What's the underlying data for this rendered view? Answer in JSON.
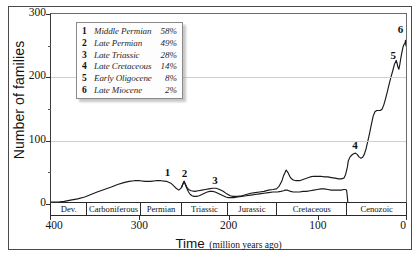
{
  "chart_data": {
    "type": "line",
    "title": "",
    "xlabel_main": "Time",
    "xlabel_sub": "(million years ago)",
    "ylabel": "Number of families",
    "xlim": [
      400,
      0
    ],
    "ylim": [
      0,
      300
    ],
    "x_reversed": true,
    "grid": true,
    "legend_position": "top-left-inside",
    "y_ticks": [
      0,
      100,
      200,
      300
    ],
    "y_tick_labels": [
      "0",
      "100",
      "200",
      "300"
    ],
    "y_minor_ticks": [
      50,
      150,
      250
    ],
    "x_ticks": [
      400,
      300,
      200,
      100,
      0
    ],
    "x_tick_labels": [
      "400",
      "300",
      "200",
      "100",
      "0"
    ],
    "periods": [
      {
        "label": "Dev.",
        "start": 400,
        "end": 359
      },
      {
        "label": "Carboniferous",
        "start": 359,
        "end": 299
      },
      {
        "label": "Permian",
        "start": 299,
        "end": 252
      },
      {
        "label": "Triassic",
        "start": 252,
        "end": 201
      },
      {
        "label": "Jurassic",
        "start": 201,
        "end": 145
      },
      {
        "label": "Cretaceous",
        "start": 145,
        "end": 66
      },
      {
        "label": "Cenozoic",
        "start": 66,
        "end": 0
      }
    ],
    "series": [
      {
        "name": "total-families",
        "points": [
          [
            400,
            0
          ],
          [
            392,
            0
          ],
          [
            385,
            1
          ],
          [
            378,
            3
          ],
          [
            370,
            5
          ],
          [
            362,
            8
          ],
          [
            355,
            12
          ],
          [
            348,
            16
          ],
          [
            340,
            20
          ],
          [
            332,
            24
          ],
          [
            325,
            28
          ],
          [
            318,
            31
          ],
          [
            312,
            33
          ],
          [
            306,
            34
          ],
          [
            300,
            34
          ],
          [
            294,
            33
          ],
          [
            288,
            33
          ],
          [
            282,
            34
          ],
          [
            276,
            34
          ],
          [
            270,
            33
          ],
          [
            265,
            30
          ],
          [
            262,
            26
          ],
          [
            259,
            22
          ],
          [
            256,
            19
          ],
          [
            253,
            23
          ],
          [
            251,
            30
          ],
          [
            250,
            33
          ],
          [
            249,
            30
          ],
          [
            247,
            24
          ],
          [
            245,
            20
          ],
          [
            242,
            18
          ],
          [
            238,
            17
          ],
          [
            234,
            18
          ],
          [
            230,
            19
          ],
          [
            226,
            20
          ],
          [
            222,
            21
          ],
          [
            218,
            22
          ],
          [
            214,
            22
          ],
          [
            210,
            20
          ],
          [
            206,
            17
          ],
          [
            202,
            13
          ],
          [
            198,
            10
          ],
          [
            195,
            9
          ],
          [
            190,
            9
          ],
          [
            185,
            10
          ],
          [
            180,
            12
          ],
          [
            175,
            14
          ],
          [
            170,
            15
          ],
          [
            165,
            16
          ],
          [
            160,
            17
          ],
          [
            155,
            19
          ],
          [
            150,
            20
          ],
          [
            146,
            21
          ],
          [
            143,
            25
          ],
          [
            140,
            33
          ],
          [
            138,
            42
          ],
          [
            136,
            48
          ],
          [
            135,
            51
          ],
          [
            133,
            47
          ],
          [
            131,
            41
          ],
          [
            129,
            37
          ],
          [
            127,
            35
          ],
          [
            124,
            34
          ],
          [
            120,
            34
          ],
          [
            116,
            36
          ],
          [
            112,
            38
          ],
          [
            108,
            40
          ],
          [
            104,
            41
          ],
          [
            100,
            41
          ],
          [
            96,
            41
          ],
          [
            92,
            40
          ],
          [
            88,
            40
          ],
          [
            84,
            39
          ],
          [
            80,
            38
          ],
          [
            76,
            37
          ],
          [
            73,
            37
          ],
          [
            70,
            38
          ],
          [
            68,
            44
          ],
          [
            66,
            56
          ],
          [
            65,
            66
          ],
          [
            63,
            72
          ],
          [
            61,
            75
          ],
          [
            59,
            77
          ],
          [
            57,
            78
          ],
          [
            55,
            76
          ],
          [
            53,
            72
          ],
          [
            51,
            70
          ],
          [
            49,
            71
          ],
          [
            47,
            76
          ],
          [
            45,
            85
          ],
          [
            43,
            97
          ],
          [
            41,
            110
          ],
          [
            39,
            124
          ],
          [
            37,
            137
          ],
          [
            35,
            144
          ],
          [
            33,
            146
          ],
          [
            31,
            146
          ],
          [
            29,
            146
          ],
          [
            27,
            148
          ],
          [
            25,
            155
          ],
          [
            23,
            165
          ],
          [
            21,
            176
          ],
          [
            19,
            188
          ],
          [
            17,
            199
          ],
          [
            15,
            209
          ],
          [
            13,
            220
          ],
          [
            11,
            226
          ],
          [
            10,
            221
          ],
          [
            9,
            215
          ],
          [
            8,
            212
          ],
          [
            7,
            219
          ],
          [
            6,
            228
          ],
          [
            5,
            236
          ],
          [
            4,
            243
          ],
          [
            3,
            249
          ],
          [
            2,
            252
          ],
          [
            1,
            254
          ],
          [
            0.6,
            258
          ],
          [
            0.3,
            253
          ],
          [
            0,
            249
          ]
        ]
      },
      {
        "name": "lower-curve",
        "points": [
          [
            253,
            23
          ],
          [
            251,
            30
          ],
          [
            250,
            33
          ],
          [
            249,
            29
          ],
          [
            247,
            22
          ],
          [
            245,
            16
          ],
          [
            243,
            12
          ],
          [
            241,
            10
          ],
          [
            239,
            9
          ],
          [
            236,
            9
          ],
          [
            233,
            10
          ],
          [
            230,
            12
          ],
          [
            227,
            14
          ],
          [
            224,
            16
          ],
          [
            221,
            17
          ],
          [
            218,
            17
          ],
          [
            215,
            16
          ],
          [
            212,
            14
          ],
          [
            209,
            12
          ],
          [
            206,
            10
          ],
          [
            203,
            8
          ],
          [
            200,
            7
          ],
          [
            197,
            7
          ],
          [
            194,
            7
          ],
          [
            190,
            8
          ],
          [
            185,
            9
          ],
          [
            180,
            10
          ],
          [
            175,
            11
          ],
          [
            170,
            12
          ],
          [
            165,
            13
          ],
          [
            160,
            14
          ],
          [
            155,
            15
          ],
          [
            150,
            16
          ],
          [
            145,
            16
          ],
          [
            141,
            17
          ],
          [
            138,
            18
          ],
          [
            136,
            19
          ],
          [
            134,
            19
          ],
          [
            132,
            18
          ],
          [
            130,
            17
          ],
          [
            127,
            16
          ],
          [
            124,
            16
          ],
          [
            120,
            16
          ],
          [
            116,
            17
          ],
          [
            112,
            17
          ],
          [
            108,
            18
          ],
          [
            104,
            19
          ],
          [
            100,
            20
          ],
          [
            96,
            21
          ],
          [
            92,
            21
          ],
          [
            88,
            20
          ],
          [
            84,
            19
          ],
          [
            80,
            19
          ],
          [
            76,
            19
          ],
          [
            73,
            19
          ],
          [
            70,
            20
          ],
          [
            68,
            20
          ],
          [
            67,
            19
          ],
          [
            66.5,
            14
          ],
          [
            66,
            7
          ],
          [
            65.7,
            2
          ],
          [
            65.5,
            0
          ]
        ]
      }
    ],
    "markers": [
      {
        "id": "1",
        "label": "1",
        "x": 268,
        "y": 34,
        "event": "Middle Permian",
        "extinction_pct": "58%"
      },
      {
        "id": "2",
        "label": "2",
        "x": 249,
        "y": 33,
        "event": "Late Permian",
        "extinction_pct": "49%"
      },
      {
        "id": "3",
        "label": "3",
        "x": 216,
        "y": 22,
        "event": "Late Triassic",
        "extinction_pct": "28%"
      },
      {
        "id": "4",
        "label": "4",
        "x": 58,
        "y": 78,
        "event": "Late Cretaceous",
        "extinction_pct": "14%"
      },
      {
        "id": "5",
        "label": "5",
        "x": 13,
        "y": 220,
        "event": "Early Oligocene",
        "extinction_pct": "8%"
      },
      {
        "id": "6",
        "label": "6",
        "x": 1.5,
        "y": 258,
        "event": "Late Miocene",
        "extinction_pct": "2%"
      }
    ]
  },
  "legend": {
    "rows": [
      {
        "num": "1",
        "name": "Middle Permian",
        "pct": "58%"
      },
      {
        "num": "2",
        "name": "Late Permian",
        "pct": "49%"
      },
      {
        "num": "3",
        "name": "Late Triassic",
        "pct": "28%"
      },
      {
        "num": "4",
        "name": "Late Cretaceous",
        "pct": "14%"
      },
      {
        "num": "5",
        "name": "Early Oligocene",
        "pct": "8%"
      },
      {
        "num": "6",
        "name": "Late Miocene",
        "pct": "2%"
      }
    ]
  },
  "colors": {
    "line": "#1a1a1a",
    "grid": "#cfcfcf",
    "axis": "#2a2a2a",
    "text": "#141414",
    "legend_bg": "#fdfdfd",
    "legend_border": "#8a8a8a"
  }
}
